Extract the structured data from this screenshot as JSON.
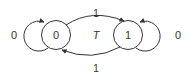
{
  "diagram": {
    "title": "T",
    "type": "state-diagram",
    "states": [
      {
        "id": "s0",
        "label": "0"
      },
      {
        "id": "s1",
        "label": "1"
      }
    ],
    "transitions": [
      {
        "from": "s0",
        "to": "s1",
        "label": "1"
      },
      {
        "from": "s1",
        "to": "s0",
        "label": "1"
      },
      {
        "from": "s0",
        "to": "s0",
        "label": "0"
      },
      {
        "from": "s1",
        "to": "s1",
        "label": "0"
      }
    ],
    "colors": {
      "stroke": "#333333",
      "text": "#333333",
      "background": "#ffffff"
    }
  }
}
